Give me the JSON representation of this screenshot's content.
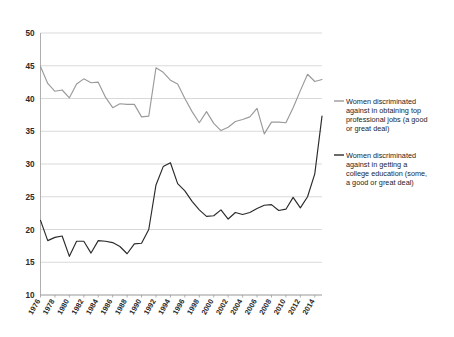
{
  "chart_data": {
    "type": "line",
    "title": "",
    "subtitle": "",
    "xlabel": "",
    "ylabel": "",
    "grid": true,
    "legend_position": "right",
    "ylim": [
      10,
      50
    ],
    "ytick_values": [
      10,
      15,
      20,
      25,
      30,
      35,
      40,
      45,
      50
    ],
    "ytick_labels": [
      "10",
      "15",
      "20",
      "25",
      "30",
      "35",
      "40",
      "45",
      "50"
    ],
    "xlim": [
      1976,
      2015
    ],
    "xtick_labels": [
      "1976",
      "1978",
      "1980",
      "1982",
      "1984",
      "1986",
      "1988",
      "1990",
      "1992",
      "1994",
      "1996",
      "1998",
      "2000",
      "2002",
      "2004",
      "2006",
      "2008",
      "2010",
      "2012",
      "2014"
    ],
    "xtick_values": [
      1976,
      1978,
      1980,
      1982,
      1984,
      1986,
      1988,
      1990,
      1992,
      1994,
      1996,
      1998,
      2000,
      2002,
      2004,
      2006,
      2008,
      2010,
      2012,
      2014
    ],
    "x": [
      1976,
      1977,
      1978,
      1979,
      1980,
      1981,
      1982,
      1983,
      1984,
      1985,
      1986,
      1987,
      1988,
      1989,
      1990,
      1991,
      1992,
      1993,
      1994,
      1995,
      1996,
      1997,
      1998,
      1999,
      2000,
      2001,
      2002,
      2003,
      2004,
      2005,
      2006,
      2007,
      2008,
      2009,
      2010,
      2011,
      2012,
      2013,
      2014,
      2015
    ],
    "series": [
      {
        "name": "Women discriminated against in obtaining top professional jobs (a good or great deal)",
        "color": "#9a9a9a",
        "values": [
          44.9,
          42.3,
          41.1,
          41.3,
          40.1,
          42.2,
          43.0,
          42.4,
          42.5,
          40.2,
          38.6,
          39.2,
          39.1,
          39.1,
          37.2,
          37.3,
          44.7,
          44.0,
          42.8,
          42.2,
          40.0,
          38.0,
          36.3,
          38.0,
          36.2,
          35.1,
          35.6,
          36.5,
          36.8,
          37.2,
          38.5,
          34.6,
          36.4,
          36.4,
          36.3,
          38.6,
          41.2,
          43.7,
          42.6,
          42.9
        ]
      },
      {
        "name": "Women discriminated against in getting a college education (some, a good or great deal)",
        "color": "#2a2a2a",
        "values": [
          21.4,
          18.3,
          18.8,
          19.0,
          15.9,
          18.2,
          18.2,
          16.4,
          18.3,
          18.2,
          18.0,
          17.4,
          16.3,
          17.8,
          17.9,
          20.0,
          26.8,
          29.6,
          30.2,
          27.0,
          25.9,
          24.3,
          23.0,
          22.0,
          22.1,
          23.0,
          21.6,
          22.6,
          22.3,
          22.6,
          23.2,
          23.7,
          23.8,
          22.9,
          23.1,
          24.9,
          23.3,
          25.0,
          28.5,
          37.3
        ]
      }
    ],
    "legend": [
      {
        "label_lines": [
          "Women discriminated",
          "against in obtaining top",
          "professional jobs (a good",
          "or great deal)"
        ],
        "color": "#9a9a9a"
      },
      {
        "label_lines": [
          "Women discriminated",
          "against in getting a",
          "college education (some,",
          "a good or great deal)"
        ],
        "color": "#2a2a2a"
      }
    ]
  }
}
